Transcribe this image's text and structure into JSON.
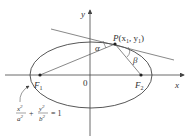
{
  "diagram": {
    "type": "ellipse-reflection-property",
    "axes": {
      "x_label": "x",
      "y_label": "y",
      "origin_label": "0"
    },
    "point": {
      "name": "P",
      "coords": "(x",
      "sub1": "1",
      "comma": ", y",
      "sub2": "1",
      "close": ")"
    },
    "foci": [
      {
        "name": "F",
        "sub": "1"
      },
      {
        "name": "F",
        "sub": "2"
      }
    ],
    "angles": {
      "alpha": "α",
      "beta": "β"
    },
    "equation": {
      "t1_num": "x",
      "t1_den": "a",
      "plus": "+",
      "t2_num": "y",
      "t2_den": "b",
      "rhs": "= 1",
      "exp": "2"
    },
    "colors": {
      "stroke": "#444444",
      "text": "#333333"
    }
  }
}
